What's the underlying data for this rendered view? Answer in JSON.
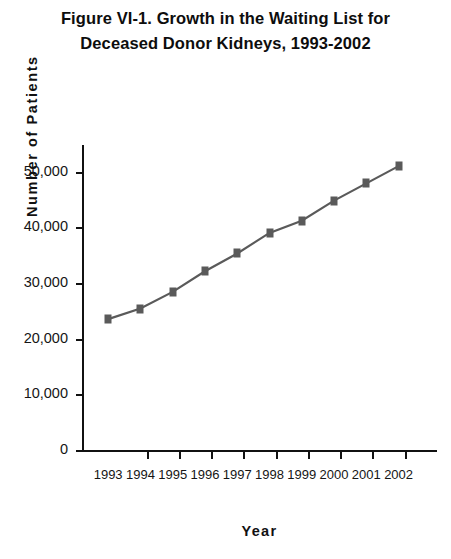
{
  "figure": {
    "title_line1": "Figure VI-1. Growth in the Waiting List for",
    "title_line2": "Deceased Donor Kidneys, 1993-2002"
  },
  "chart_data": {
    "type": "line",
    "title": "Figure VI-1. Growth in the Waiting List for Deceased Donor Kidneys, 1993-2002",
    "xlabel": "Year",
    "ylabel": "Number of Patients",
    "categories": [
      "1993",
      "1994",
      "1995",
      "1996",
      "1997",
      "1998",
      "1999",
      "2000",
      "2001",
      "2002"
    ],
    "values": [
      23700,
      25600,
      28600,
      32300,
      35500,
      39200,
      41400,
      45000,
      48100,
      51200
    ],
    "ylim": [
      0,
      55000
    ],
    "yticks": [
      0,
      10000,
      20000,
      30000,
      40000,
      50000
    ],
    "ytick_labels": [
      "0",
      "10,000",
      "20,000",
      "30,000",
      "40,000",
      "50,000"
    ],
    "grid": false,
    "legend": false,
    "marker": "square",
    "series_color": "#5a5a5a",
    "axis_color": "#111111"
  }
}
